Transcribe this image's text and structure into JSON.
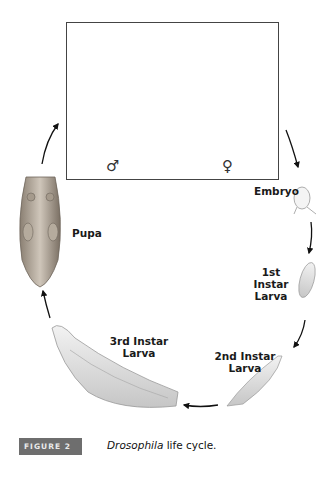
{
  "figure": {
    "badge": "FIGURE 2",
    "caption_italic": "Drosophila",
    "caption_rest": " life cycle."
  },
  "adults": {
    "male_symbol": "♂",
    "female_symbol": "♀"
  },
  "stages": [
    {
      "id": "embryo",
      "label": "Embryo"
    },
    {
      "id": "first-instar",
      "label_line1": "1st Instar",
      "label_line2": "Larva"
    },
    {
      "id": "second-instar",
      "label_line1": "2nd Instar",
      "label_line2": "Larva"
    },
    {
      "id": "third-instar",
      "label_line1": "3rd Instar",
      "label_line2": "Larva"
    },
    {
      "id": "pupa",
      "label": "Pupa"
    }
  ],
  "cycle_order": [
    "Adults",
    "Embryo",
    "1st Instar Larva",
    "2nd Instar Larva",
    "3rd Instar Larva",
    "Pupa"
  ]
}
